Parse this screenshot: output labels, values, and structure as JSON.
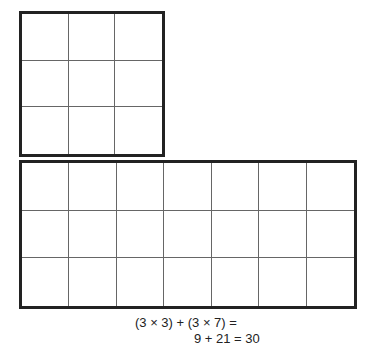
{
  "diagram": {
    "top_grid": {
      "rows": 3,
      "cols": 3
    },
    "bottom_grid": {
      "rows": 3,
      "cols": 7
    },
    "equation_line1": "(3 × 3) + (3 × 7) =",
    "equation_line2": "9 + 21 = 30"
  }
}
